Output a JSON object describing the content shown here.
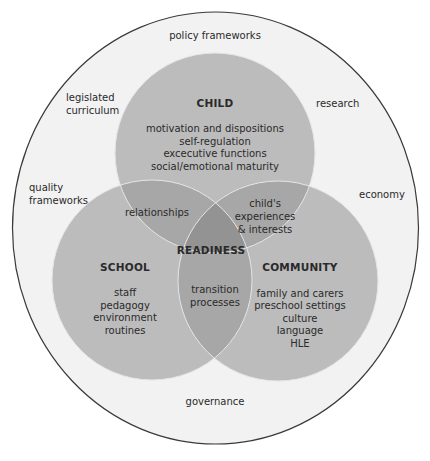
{
  "diagram": {
    "colors": {
      "page_bg": "#ffffff",
      "outer_bg": "#f2f2f2",
      "outer_stroke": "#3a3a3a",
      "circle_fill": "#bcbcbc",
      "double_overlap": "#a7a7a7",
      "triple_overlap": "#939393",
      "circle_stroke": "#e6e6e6",
      "text": "#2a2a2a"
    },
    "context": {
      "top": "policy frameworks",
      "upper_left": [
        "legislated",
        "curriculum"
      ],
      "upper_right": "research",
      "left": [
        "quality",
        "frameworks"
      ],
      "right": "economy",
      "bottom": "governance"
    },
    "child": {
      "heading": "CHILD",
      "items": [
        "motivation and dispositions",
        "self-regulation",
        "excecutive functions",
        "social/emotional maturity"
      ]
    },
    "school": {
      "heading": "SCHOOL",
      "items": [
        "staff",
        "pedagogy",
        "environment",
        "routines"
      ]
    },
    "community": {
      "heading": "COMMUNITY",
      "items": [
        "family and carers",
        "preschool settings",
        "culture",
        "language",
        "HLE"
      ]
    },
    "overlaps": {
      "child_school": "relationships",
      "child_community": [
        "child's",
        "experiences",
        "& interests"
      ],
      "school_community": [
        "transition",
        "processes"
      ],
      "center": "READINESS"
    }
  }
}
